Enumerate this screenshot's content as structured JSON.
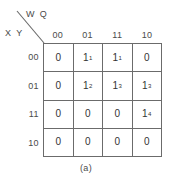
{
  "figure": {
    "caption": "(a)",
    "type": "karnaugh-map"
  },
  "axes": {
    "column_variables_label": "W Q",
    "row_variables_label": "X Y",
    "column_headers": [
      "00",
      "01",
      "11",
      "10"
    ],
    "row_headers": [
      "00",
      "01",
      "11",
      "10"
    ]
  },
  "cells": [
    [
      {
        "value": "0",
        "sup": ""
      },
      {
        "value": "1",
        "sup": "1"
      },
      {
        "value": "1",
        "sup": "1"
      },
      {
        "value": "0",
        "sup": ""
      }
    ],
    [
      {
        "value": "0",
        "sup": ""
      },
      {
        "value": "1",
        "sup": "2"
      },
      {
        "value": "1",
        "sup": "3"
      },
      {
        "value": "1",
        "sup": "3"
      }
    ],
    [
      {
        "value": "0",
        "sup": ""
      },
      {
        "value": "0",
        "sup": ""
      },
      {
        "value": "0",
        "sup": ""
      },
      {
        "value": "1",
        "sup": "4"
      }
    ],
    [
      {
        "value": "0",
        "sup": ""
      },
      {
        "value": "0",
        "sup": ""
      },
      {
        "value": "0",
        "sup": ""
      },
      {
        "value": "0",
        "sup": ""
      }
    ]
  ],
  "colors": {
    "grid_line": "#6b6b6b",
    "text": "#3a3a3a",
    "background": "#ffffff"
  }
}
